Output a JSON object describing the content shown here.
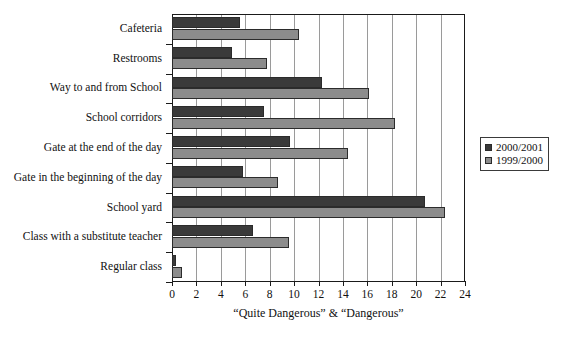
{
  "chart_data": {
    "type": "bar",
    "orientation": "horizontal",
    "title": "",
    "xlabel": "“Quite Dangerous” & “Dangerous”",
    "ylabel": "",
    "xlim": [
      0,
      24
    ],
    "xticks": [
      0,
      2,
      4,
      6,
      8,
      10,
      12,
      14,
      16,
      18,
      20,
      22,
      24
    ],
    "grid": "vertical",
    "legend_position": "right",
    "categories": [
      "Cafeteria",
      "Restrooms",
      "Way to and from School",
      "School corridors",
      "Gate at the end of the day",
      "Gate in the beginning of the day",
      "School yard",
      "Class with a substitute teacher",
      "Regular class"
    ],
    "series": [
      {
        "name": "2000/2001",
        "color": "#3a3a3a",
        "values": [
          5.6,
          4.9,
          12.3,
          7.5,
          9.7,
          5.8,
          20.7,
          6.6,
          0.3
        ]
      },
      {
        "name": "1999/2000",
        "color": "#8c8c8c",
        "values": [
          10.4,
          7.8,
          16.1,
          18.3,
          14.4,
          8.7,
          22.4,
          9.6,
          0.8
        ]
      }
    ]
  },
  "legend": {
    "entries": [
      {
        "label": "2000/2001",
        "color": "#3a3a3a"
      },
      {
        "label": "1999/2000",
        "color": "#8c8c8c"
      }
    ]
  },
  "axis": {
    "x_title": "“Quite Dangerous” & “Dangerous”"
  }
}
